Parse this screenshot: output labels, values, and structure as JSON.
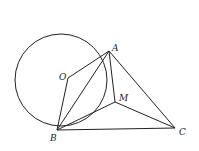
{
  "figure": {
    "circle": {
      "cx": 61,
      "cy": 80,
      "r": 46
    },
    "points": {
      "A": {
        "x": 109,
        "y": 51,
        "label": "A"
      },
      "O": {
        "x": 68,
        "y": 78,
        "label": "O"
      },
      "M": {
        "x": 115,
        "y": 102,
        "label": "M"
      },
      "B": {
        "x": 57,
        "y": 130,
        "label": "B"
      },
      "C": {
        "x": 175,
        "y": 128,
        "label": "C"
      }
    },
    "segments": [
      [
        "O",
        "A"
      ],
      [
        "O",
        "B"
      ],
      [
        "A",
        "B"
      ],
      [
        "A",
        "M"
      ],
      [
        "B",
        "M"
      ],
      [
        "M",
        "C"
      ],
      [
        "A",
        "C"
      ],
      [
        "B",
        "C"
      ]
    ]
  }
}
